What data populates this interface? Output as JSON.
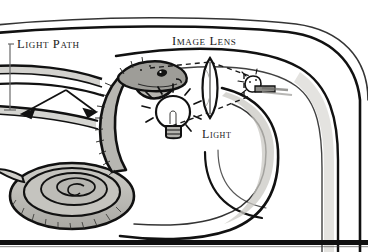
{
  "figure": {
    "style": "pen-and-ink line drawing with gray wash",
    "width": 368,
    "height": 252
  },
  "labels": {
    "light_path": "Light Path",
    "image_lens": "Image Lens",
    "light": "Light"
  },
  "colors": {
    "ink": "#111111",
    "paper": "#ffffff",
    "wash_light": "#d6d5d0",
    "wash_mid": "#b2b1ac",
    "wash_dark": "#8d8c88",
    "snake_body": "#b9b8b2",
    "snake_dark": "#6d6c68"
  },
  "elements": {
    "leader_line": "vertical leader from Light Path label down to beam",
    "arrows": [
      "arrow-left-up",
      "arrow-right-down"
    ],
    "lens": "biconvex lens",
    "bulb": "incandescent light bulb with rays",
    "inverted_image": "small inverted image of bulb right of lens",
    "snake": "coiled snake with raised head facing the lens",
    "chamber": "nested curved tube walls forming a chamber",
    "bottom_rule": "thick black horizontal rule at page bottom"
  }
}
